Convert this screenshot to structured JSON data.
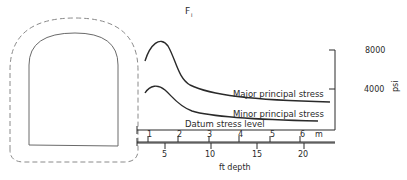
{
  "figure": {
    "title_label": "F",
    "title_subscript": "I"
  },
  "curves": {
    "major_label": "Major principal stress",
    "minor_label": "Minor principal stress",
    "datum_label": "Datum stress level"
  },
  "stress_axis": {
    "unit": "psi",
    "ticks": [
      {
        "label": "8000"
      },
      {
        "label": "4000"
      }
    ]
  },
  "depth_axis_m": {
    "unit": "m",
    "ticks": [
      {
        "label": "1"
      },
      {
        "label": "2"
      },
      {
        "label": "3"
      },
      {
        "label": "4"
      },
      {
        "label": "5"
      },
      {
        "label": "6"
      }
    ]
  },
  "depth_axis_ft": {
    "caption": "ft depth",
    "ticks": [
      {
        "label": "5"
      },
      {
        "label": "10"
      },
      {
        "label": "15"
      },
      {
        "label": "20"
      }
    ]
  },
  "colors": {
    "line": "#2a2a2a",
    "dashed": "#8a8a8a",
    "tunnel": "#6a6a6a"
  }
}
